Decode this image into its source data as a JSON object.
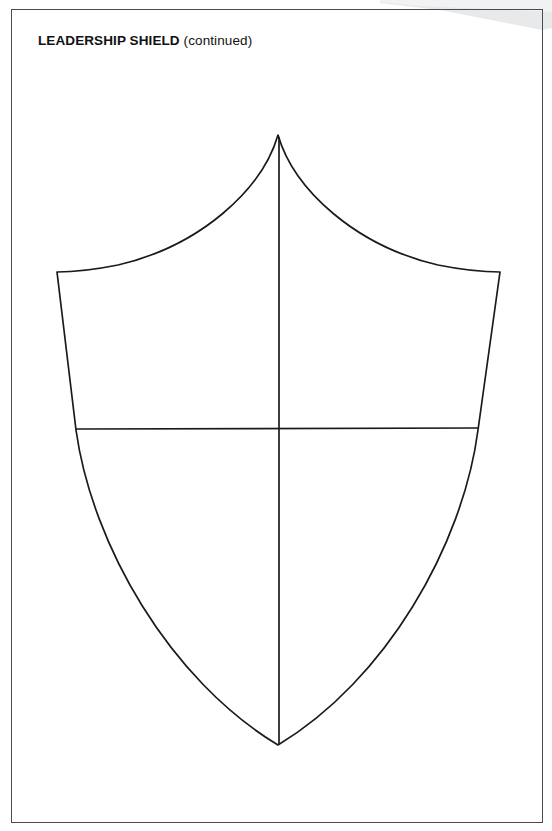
{
  "page": {
    "title_bold": "LEADERSHIP SHIELD",
    "title_regular": " (continued)",
    "background_color": "#ffffff",
    "border_color": "#4b4b4d",
    "curl_color": "#e8e9ea"
  },
  "worksheet": {
    "heading": "LEADERSHIP SHIELD (continued)",
    "shield": {
      "name": "leadership-shield-outline",
      "stroke_color": "#1a1a1a",
      "fill_color": "#ffffff",
      "apex_point": "278,135",
      "bottom_point": "278,745",
      "left_shoulder": "57,272",
      "right_shoulder": "500,272",
      "divider_horizontal_y": 429,
      "divider_vertical_x": 279,
      "quadrant_count": 4,
      "quadrant_labels": [
        "",
        "",
        "",
        ""
      ]
    }
  }
}
